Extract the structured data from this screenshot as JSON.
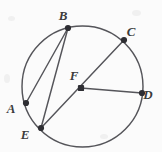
{
  "figure": {
    "kind": "circle-geometry-diagram",
    "width": 162,
    "height": 152,
    "background_color": "#fbfbfb",
    "stroke_color": "#55555a",
    "label_color": "#3b3b3b",
    "vertex_color": "#2e2e33"
  },
  "circle": {
    "name": "circle-F",
    "center_label": "F",
    "cx": 82.5,
    "cy": 86.5,
    "r": 60.5
  },
  "points": [
    {
      "label": "A",
      "x": 26,
      "y": 103,
      "label_x": 11,
      "label_y": 113,
      "on_circle": true
    },
    {
      "label": "B",
      "x": 68,
      "y": 28,
      "label_x": 63,
      "label_y": 20,
      "on_circle": true
    },
    {
      "label": "C",
      "x": 124,
      "y": 40,
      "label_x": 131,
      "label_y": 36,
      "on_circle": true
    },
    {
      "label": "D",
      "x": 142,
      "y": 93,
      "label_x": 148,
      "label_y": 99,
      "on_circle": true
    },
    {
      "label": "E",
      "x": 41,
      "y": 128,
      "label_x": 25,
      "label_y": 139,
      "on_circle": true
    },
    {
      "label": "F",
      "x": 81,
      "y": 88,
      "label_x": 74,
      "label_y": 80,
      "on_circle": false
    }
  ],
  "segments": [
    {
      "name": "chord-AB",
      "from": "A",
      "to": "B",
      "x1": 26,
      "y1": 103,
      "x2": 68,
      "y2": 28
    },
    {
      "name": "chord-BE",
      "from": "B",
      "to": "E",
      "x1": 68,
      "y1": 28,
      "x2": 41,
      "y2": 128
    },
    {
      "name": "chord-EC",
      "from": "E",
      "to": "C",
      "x1": 41,
      "y1": 128,
      "x2": 124,
      "y2": 40
    },
    {
      "name": "radius-FD",
      "from": "F",
      "to": "D",
      "x1": 81,
      "y1": 88,
      "x2": 142,
      "y2": 93
    }
  ]
}
